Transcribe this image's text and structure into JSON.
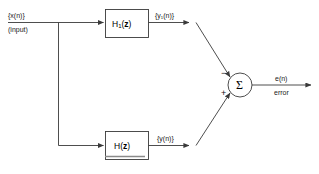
{
  "diagram": {
    "stroke_color": "#3a3a3a",
    "text_color": "#1a1a1a",
    "background": "#ffffff",
    "input": {
      "signal_label": "{x(n)}",
      "descriptor_label": "(input)"
    },
    "blocks": [
      {
        "id": "h1-block",
        "label_main": "H",
        "label_sub": "1",
        "label_tail_open": "(",
        "label_var": "z",
        "label_tail_close": ")",
        "output_label": "{y₁(n)}"
      },
      {
        "id": "h-block",
        "label_main": "H",
        "label_sub": "",
        "label_tail_open": "(",
        "label_var": "z",
        "label_tail_close": ")",
        "output_label": "{y(n)}"
      }
    ],
    "summer": {
      "symbol": "Σ",
      "top_input_sign": "−",
      "bottom_input_sign": "+"
    },
    "output": {
      "signal_label": "e(n)",
      "descriptor_label": "error"
    },
    "caption": ""
  }
}
